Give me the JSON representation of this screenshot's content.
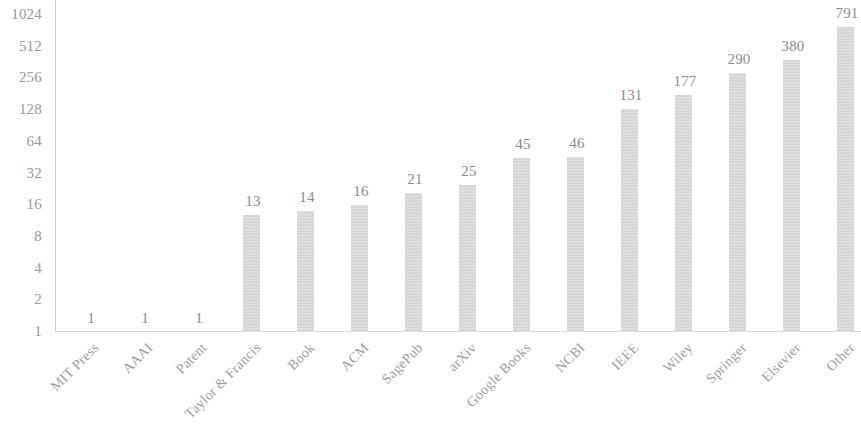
{
  "chart_data": {
    "type": "bar",
    "title": "",
    "subtitle": "",
    "xlabel": "",
    "ylabel": "",
    "yscale": "log2",
    "ylim": [
      1,
      1024
    ],
    "grid": false,
    "legend": null,
    "orientation": "vertical",
    "bar_color": "#d6d6d6",
    "text_color": "#8d8d8d",
    "axis_color": "#cfcfcf",
    "y_ticks": [
      1,
      2,
      4,
      8,
      16,
      32,
      64,
      128,
      256,
      512,
      1024
    ],
    "y_tick_labels": [
      "1",
      "2",
      "4",
      "8",
      "16",
      "32",
      "64",
      "128",
      "256",
      "512",
      "1024"
    ],
    "categories": [
      "MIT Press",
      "AAAI",
      "Patent",
      "Taylor & Francis",
      "Book",
      "ACM",
      "SagePub",
      "arXiv",
      "Google Books",
      "NCBI",
      "IEEE",
      "Wiley",
      "Springer",
      "Elsevier",
      "Other"
    ],
    "values": [
      1,
      1,
      1,
      13,
      14,
      16,
      21,
      25,
      45,
      46,
      131,
      177,
      290,
      380,
      791
    ],
    "value_labels": [
      "1",
      "1",
      "1",
      "13",
      "14",
      "16",
      "21",
      "25",
      "45",
      "46",
      "131",
      "177",
      "290",
      "380",
      "791"
    ]
  }
}
